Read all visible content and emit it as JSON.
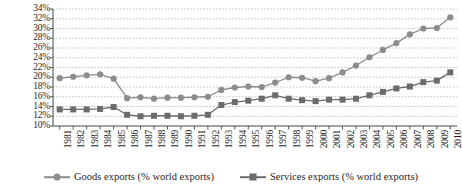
{
  "chart_data": {
    "type": "line",
    "title": "",
    "subtitle": "",
    "xlabel": "",
    "ylabel": "",
    "grid": true,
    "legend_position": "bottom",
    "ylim": [
      10,
      34
    ],
    "ytick_step": 2,
    "ytick_labels": [
      "34%",
      "32%",
      "30%",
      "28%",
      "26%",
      "24%",
      "22%",
      "20%",
      "18%",
      "16%",
      "14%",
      "12%",
      "10%"
    ],
    "ytick_values": [
      34,
      32,
      30,
      28,
      26,
      24,
      22,
      20,
      18,
      16,
      14,
      12,
      10
    ],
    "categories": [
      "1981",
      "1982",
      "1983",
      "1984",
      "1985",
      "1986",
      "1987",
      "1988",
      "1989",
      "1990",
      "1991",
      "1992",
      "1993",
      "1994",
      "1995",
      "1996",
      "1997",
      "1998",
      "1999",
      "2000",
      "2001",
      "2002",
      "2003",
      "2004",
      "2005",
      "2006",
      "2007",
      "2008",
      "2009",
      "2010"
    ],
    "x": [
      1981,
      1982,
      1983,
      1984,
      1985,
      1986,
      1987,
      1988,
      1989,
      1990,
      1991,
      1992,
      1993,
      1994,
      1995,
      1996,
      1997,
      1998,
      1999,
      2000,
      2001,
      2002,
      2003,
      2004,
      2005,
      2006,
      2007,
      2008,
      2009,
      2010
    ],
    "series": [
      {
        "name": "Goods exports (% world exports)",
        "marker": "circle",
        "color": "#8c8c8c",
        "values": [
          19.8,
          20.1,
          20.4,
          20.6,
          19.7,
          15.7,
          15.9,
          15.6,
          15.8,
          15.8,
          15.9,
          16.0,
          17.4,
          17.9,
          18.1,
          18.0,
          18.9,
          20.0,
          19.9,
          19.2,
          19.8,
          21.0,
          22.4,
          24.1,
          25.6,
          27.0,
          28.8,
          30.0,
          30.1,
          32.3
        ]
      },
      {
        "name": "Services exports (% world exports)",
        "marker": "square",
        "color": "#6b6b6b",
        "values": [
          13.4,
          13.4,
          13.4,
          13.5,
          13.9,
          12.3,
          12.0,
          12.1,
          12.1,
          12.0,
          12.1,
          12.3,
          14.3,
          14.9,
          15.2,
          15.6,
          16.3,
          15.6,
          15.3,
          15.1,
          15.4,
          15.4,
          15.6,
          16.3,
          17.0,
          17.7,
          18.1,
          19.0,
          19.3,
          21.0
        ]
      }
    ]
  },
  "legend": {
    "items": [
      {
        "label": "Goods exports (% world exports)",
        "marker": "circle",
        "color": "#8c8c8c"
      },
      {
        "label": "Services exports (% world exports)",
        "marker": "square",
        "color": "#6b6b6b"
      }
    ]
  },
  "axes": {
    "axis_color": "#555555",
    "grid_color": "#b4b4b4"
  }
}
